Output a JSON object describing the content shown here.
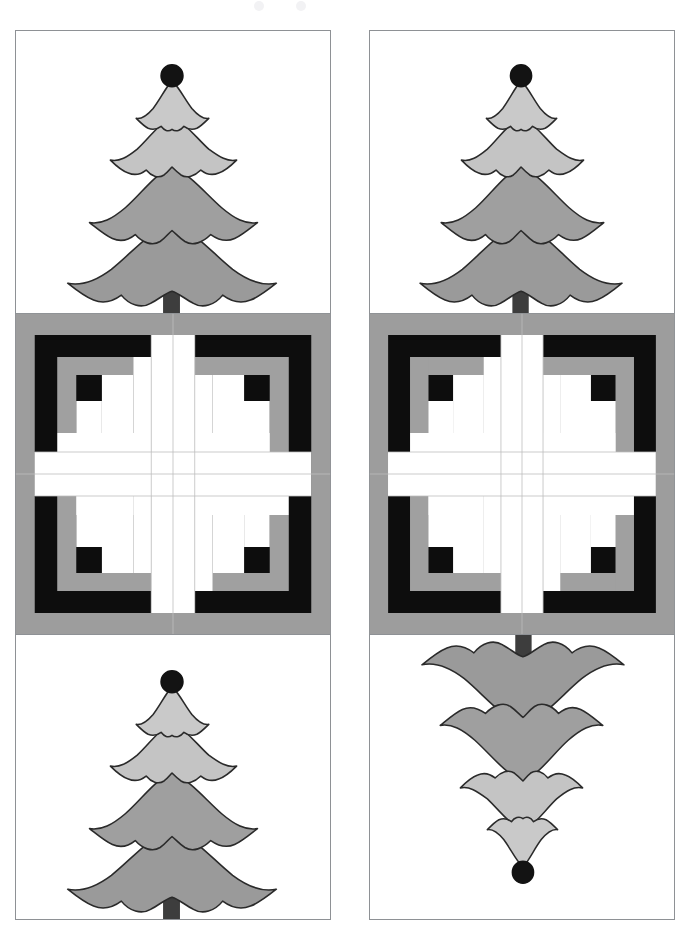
{
  "document": {
    "title": "Quilt block layout illustration",
    "type": "quilt-pattern-diagram",
    "page_background": "#ffffff",
    "columns": 2,
    "rows": 3,
    "total_blocks": 6
  },
  "palette": {
    "page_background": "#ffffff",
    "block_outline": "#8e9195",
    "fabric_white": "#ffffff",
    "fabric_light_gray": "#c9c9c9",
    "fabric_medium_gray": "#9a9a9a",
    "fabric_dark_gray": "#a0a0a0",
    "fabric_black": "#0d0d0d",
    "fabric_border_gray": "#9d9d9d",
    "applique_outline": "#2a2a2a",
    "trunk_dark": "#3d3d3d",
    "topper_black": "#131313",
    "seam_line": "#b5b5b5"
  },
  "blocks": [
    {
      "id": "block-r1c1",
      "name": "christmas-tree-block",
      "row": 1,
      "column": 1,
      "kind": "tree",
      "orientation": "upright",
      "x": 15,
      "y": 30,
      "width": 316,
      "height": 284
    },
    {
      "id": "block-r1c2",
      "name": "christmas-tree-block",
      "row": 1,
      "column": 2,
      "kind": "tree",
      "orientation": "upright",
      "x": 369,
      "y": 30,
      "width": 306,
      "height": 284
    },
    {
      "id": "block-r2c1",
      "name": "log-cabin-pinwheel-block",
      "row": 2,
      "column": 1,
      "kind": "log-cabin",
      "orientation": "upright",
      "x": 15,
      "y": 313,
      "width": 316,
      "height": 322
    },
    {
      "id": "block-r2c2",
      "name": "log-cabin-pinwheel-block",
      "row": 2,
      "column": 2,
      "kind": "log-cabin",
      "orientation": "upright",
      "x": 369,
      "y": 313,
      "width": 306,
      "height": 322
    },
    {
      "id": "block-r3c1",
      "name": "christmas-tree-block",
      "row": 3,
      "column": 1,
      "kind": "tree",
      "orientation": "upright",
      "x": 15,
      "y": 634,
      "width": 316,
      "height": 286
    },
    {
      "id": "block-r3c2",
      "name": "christmas-tree-block",
      "row": 3,
      "column": 2,
      "kind": "tree",
      "orientation": "inverted",
      "x": 369,
      "y": 634,
      "width": 306,
      "height": 286
    }
  ],
  "tree_motif": {
    "name": "appliqued-pine-tree",
    "tiers": 4,
    "tier_colors": [
      "#c9c9c9",
      "#c4c4c4",
      "#9f9f9f",
      "#9a9a9a"
    ],
    "has_topper": true,
    "topper_shape": "circle",
    "topper_color": "#131313",
    "trunk_color": "#3d3d3d",
    "outline_color": "#2a2a2a"
  },
  "log_cabin_motif": {
    "name": "log-cabin-pinwheel",
    "quadrants": 4,
    "arrangement": "rotated-pinwheel",
    "outer_border_color": "#9d9d9d",
    "log_colors": {
      "light": "#ffffff",
      "medium": "#a0a0a0",
      "dark": "#0d0d0d"
    },
    "logs_per_quadrant": 9,
    "center_square_color": "#0d0d0d"
  }
}
